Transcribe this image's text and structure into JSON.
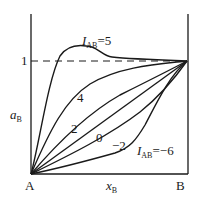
{
  "diagram": {
    "type": "activity-composition curves",
    "y_axis_label": {
      "main": "a",
      "sub": "B"
    },
    "x_axis_label": {
      "main": "x",
      "sub": "B"
    },
    "y_tick": "1",
    "left_end_label": "A",
    "right_end_label": "B",
    "reference_line": "dashed line at a_B = 1",
    "curves": [
      {
        "param": "I_AB",
        "value": 5,
        "label_main": "I",
        "label_sub": "AB",
        "label_suffix": "=5"
      },
      {
        "param": "I_AB",
        "value": 4,
        "label": "4"
      },
      {
        "param": "I_AB",
        "value": 2,
        "label": "2"
      },
      {
        "param": "I_AB",
        "value": 0,
        "label": "0"
      },
      {
        "param": "I_AB",
        "value": -2,
        "label": "−2"
      },
      {
        "param": "I_AB",
        "value": -6,
        "label_main": "I",
        "label_sub": "AB",
        "label_suffix": "=−6"
      }
    ],
    "colors": {
      "ink": "#1a1a1a",
      "background": "#ffffff"
    }
  }
}
